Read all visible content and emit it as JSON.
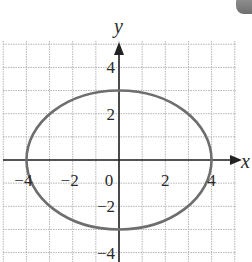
{
  "chart_data": {
    "type": "line",
    "title": "",
    "xlabel": "x",
    "ylabel": "y",
    "xlim": [
      -5,
      5
    ],
    "ylim": [
      -4,
      5
    ],
    "grid": true,
    "grid_spacing": 1,
    "x_ticks": [
      -4,
      -2,
      0,
      2,
      4
    ],
    "x_tick_labels": [
      "−4",
      "−2",
      "0",
      "2",
      "4"
    ],
    "y_ticks": [
      4,
      2,
      -2,
      -4
    ],
    "y_tick_labels": [
      "4",
      "2",
      "−2",
      "−4"
    ],
    "series": [
      {
        "name": "ellipse",
        "shape": "ellipse",
        "center": [
          0,
          0
        ],
        "semi_major_x": 4,
        "semi_minor_y": 3,
        "points": [
          [
            4,
            0
          ],
          [
            0,
            3
          ],
          [
            -4,
            0
          ],
          [
            0,
            -3
          ]
        ],
        "color": "#6e6e6e"
      }
    ]
  },
  "colors": {
    "grid": "#b5b5b5",
    "axis": "#222222",
    "curve": "#6e6e6e"
  }
}
